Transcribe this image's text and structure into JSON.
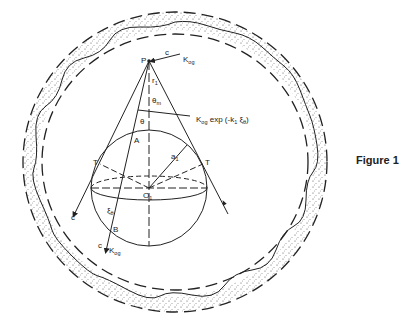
{
  "figure": {
    "caption": "Figure 1",
    "colors": {
      "ink": "#222222",
      "background": "#ffffff"
    }
  },
  "labels": {
    "P": "P",
    "c_top": "c",
    "K_top": "K",
    "K_top_sub": "og",
    "r1": "r",
    "r1_sub": "1",
    "theta_m": "θ",
    "theta_m_sub": "m",
    "theta": "θ",
    "decay": "K",
    "decay_sub": "og",
    "decay_rest": " exp (-k",
    "decay_k_sub": "1",
    "decay_xi": " ξ",
    "decay_xi_sub": "θ",
    "decay_close": ")",
    "A": "A",
    "a1": "a",
    "a1_sub": "1",
    "T_left": "T",
    "T_right": "T",
    "O1": "O",
    "O1_sub": "1",
    "xi_theta": "ξ",
    "xi_theta_sub": "θ",
    "B": "B",
    "c_left": "c",
    "c_bottom": "c",
    "K_bottom": "K",
    "K_bottom_sub": "og"
  }
}
